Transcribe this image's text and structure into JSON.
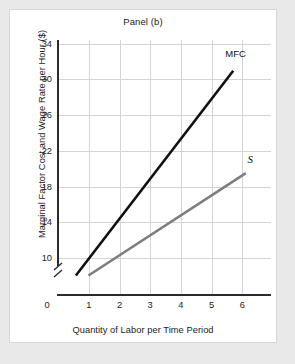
{
  "chart_data": {
    "type": "line",
    "title": "Panel (b)",
    "xlabel": "Quantity of Labor per Time Period",
    "ylabel": "Marginal Factor Cost and Wage Rate per Hour ($)",
    "xlim": [
      0,
      6.8
    ],
    "ylim": [
      10,
      35
    ],
    "y_axis_break": true,
    "grid": true,
    "legend_position": "inline-end-of-line",
    "xticks": [
      "0",
      "1",
      "2",
      "3",
      "4",
      "5",
      "6"
    ],
    "xtick_values": [
      0,
      1,
      2,
      3,
      4,
      5,
      6
    ],
    "yticks": [
      "10",
      "14",
      "18",
      "22",
      "26",
      "30",
      "34"
    ],
    "ytick_values": [
      10,
      14,
      18,
      22,
      26,
      30,
      34
    ],
    "series": [
      {
        "name": "MFC",
        "label": "MFC",
        "color": "#111111",
        "width": 2.6,
        "x": [
          0.6,
          5.6
        ],
        "values": [
          12,
          32
        ],
        "points": [
          [
            0.6,
            12
          ],
          [
            5.6,
            32
          ]
        ]
      },
      {
        "name": "S",
        "label": "S",
        "color": "#7e7e7e",
        "width": 2.6,
        "x": [
          1.0,
          6.0
        ],
        "values": [
          12,
          22
        ],
        "points": [
          [
            1.0,
            12
          ],
          [
            6.0,
            22
          ]
        ]
      }
    ],
    "annotations": [
      {
        "text": "MFC",
        "x": 5.35,
        "y": 33.6
      },
      {
        "text": "S",
        "x": 6.05,
        "y": 23.4
      }
    ],
    "colors": {
      "mfc_line": "#111111",
      "s_line": "#7e7e7e",
      "grid": "#d4d4d4",
      "axis": "#2b2b2b",
      "text": "#1c1c1c",
      "card": "#ffffff",
      "page": "#e9e9e9"
    }
  }
}
